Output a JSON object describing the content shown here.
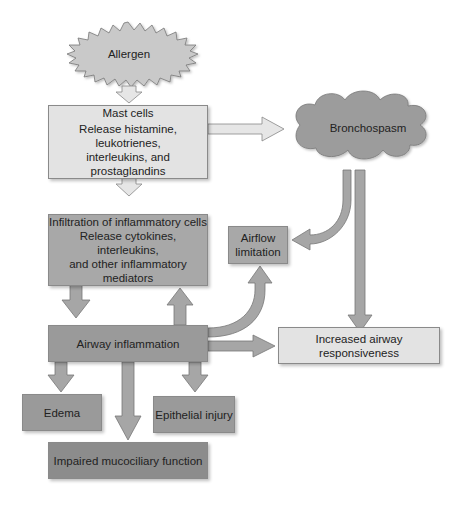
{
  "diagram": {
    "nodes": {
      "allergen": {
        "label": "Allergen"
      },
      "mast_cells": {
        "title": "Mast cells",
        "line1": "Release histamine, leukotrienes,",
        "line2": "interleukins, and prostaglandins"
      },
      "bronchospasm": {
        "label": "Bronchospasm"
      },
      "infiltration": {
        "title": "Infiltration of inflammatory cells",
        "line1": "Release cytokines, interleukins,",
        "line2": "and other inflammatory mediators"
      },
      "airflow_limitation": {
        "line1": "Airflow",
        "line2": "limitation"
      },
      "airway_inflammation": {
        "label": "Airway inflammation"
      },
      "increased_responsiveness": {
        "label": "Increased airway responsiveness"
      },
      "edema": {
        "label": "Edema"
      },
      "epithelial_injury": {
        "label": "Epithelial injury"
      },
      "impaired_mucociliary": {
        "label": "Impaired mucociliary function"
      }
    },
    "edges": [
      {
        "from": "Allergen",
        "to": "Mast cells"
      },
      {
        "from": "Mast cells",
        "to": "Bronchospasm"
      },
      {
        "from": "Mast cells",
        "to": "Infiltration of inflammatory cells"
      },
      {
        "from": "Bronchospasm",
        "to": "Airflow limitation"
      },
      {
        "from": "Bronchospasm",
        "to": "Increased airway responsiveness"
      },
      {
        "from": "Infiltration of inflammatory cells",
        "to": "Airway inflammation"
      },
      {
        "from": "Airway inflammation",
        "to": "Infiltration of inflammatory cells"
      },
      {
        "from": "Airway inflammation",
        "to": "Airflow limitation"
      },
      {
        "from": "Airway inflammation",
        "to": "Increased airway responsiveness"
      },
      {
        "from": "Airway inflammation",
        "to": "Edema"
      },
      {
        "from": "Airway inflammation",
        "to": "Impaired mucociliary function"
      },
      {
        "from": "Airway inflammation",
        "to": "Epithelial injury"
      }
    ],
    "colors": {
      "light_box": "#e3e3e3",
      "mid_box": "#a8a8a8",
      "dark_box": "#8c8c8c",
      "arrow_light": "#e6e6e6",
      "arrow_gray": "#a6a6a6"
    }
  }
}
